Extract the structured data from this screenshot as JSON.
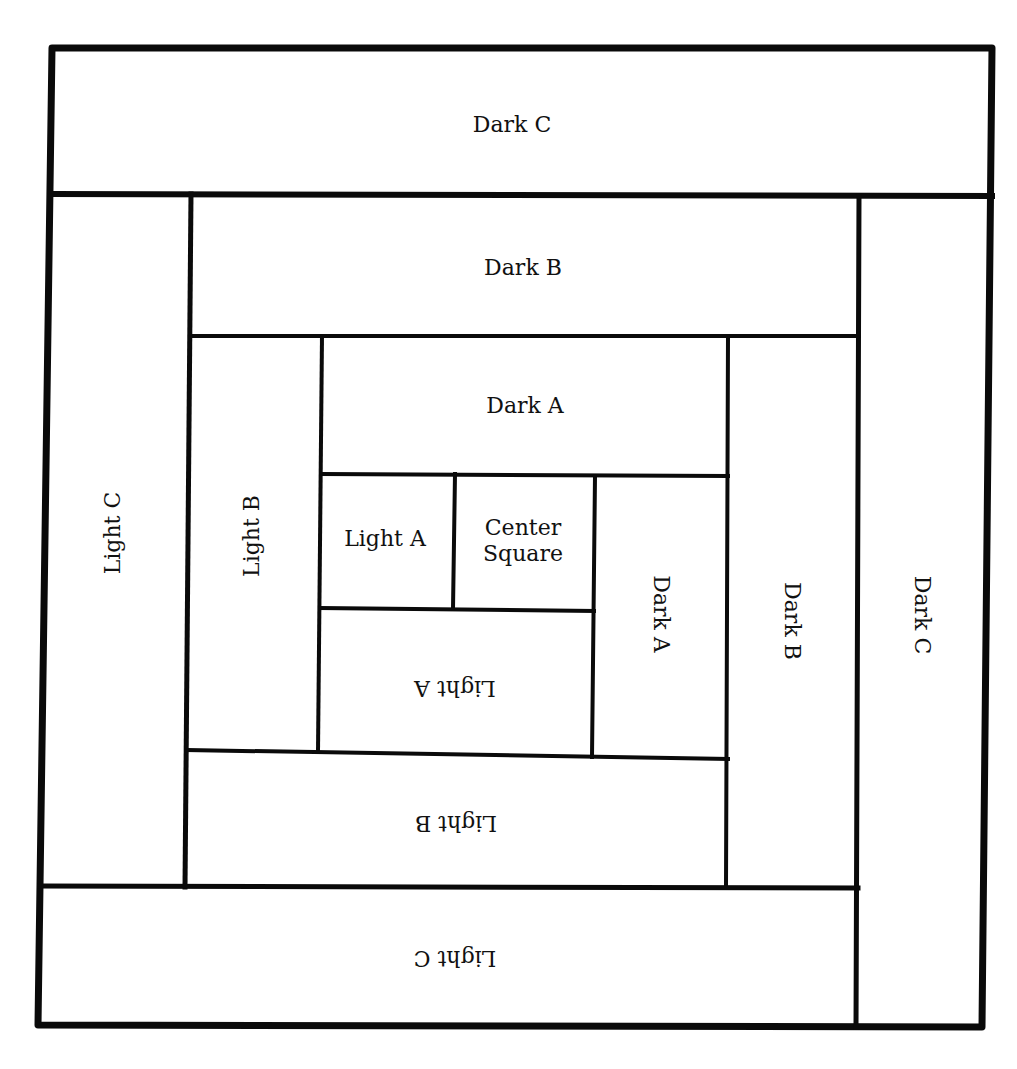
{
  "diagram": {
    "stroke_color": "#0a0a0a",
    "background": "#ffffff",
    "outer": {
      "x1": 52,
      "y1": 48,
      "x2": 992,
      "y2": 48,
      "x3": 982,
      "y3": 1027,
      "x4": 38,
      "y4": 1025,
      "stroke_width": 7
    },
    "pieces": [
      {
        "id": "dark-c-top",
        "label": "Dark C",
        "x": 52,
        "y": 48,
        "w": 940,
        "h": 146,
        "rotate": 0,
        "lx": 512,
        "ly": 125
      },
      {
        "id": "light-c-left",
        "label": "Light C",
        "x": 45,
        "y": 194,
        "w": 144,
        "h": 692,
        "rotate": -90,
        "lx": 113,
        "ly": 533
      },
      {
        "id": "dark-b-top",
        "label": "Dark B",
        "x": 189,
        "y": 194,
        "w": 668,
        "h": 142,
        "rotate": 0,
        "lx": 523,
        "ly": 268
      },
      {
        "id": "dark-c-right",
        "label": "Dark C",
        "x": 857,
        "y": 194,
        "w": 132,
        "h": 833,
        "rotate": 90,
        "lx": 922,
        "ly": 615
      },
      {
        "id": "light-b-left",
        "label": "Light B",
        "x": 189,
        "y": 336,
        "w": 132,
        "h": 416,
        "rotate": -90,
        "lx": 252,
        "ly": 536
      },
      {
        "id": "dark-a-top",
        "label": "Dark A",
        "x": 321,
        "y": 336,
        "w": 407,
        "h": 138,
        "rotate": 0,
        "lx": 525,
        "ly": 406
      },
      {
        "id": "dark-b-right",
        "label": "Dark B",
        "x": 728,
        "y": 336,
        "w": 129,
        "h": 552,
        "rotate": 90,
        "lx": 792,
        "ly": 621
      },
      {
        "id": "light-a-left",
        "label": "Light A",
        "x": 321,
        "y": 474,
        "w": 133,
        "h": 136,
        "rotate": 0,
        "lx": 385,
        "ly": 539
      },
      {
        "id": "center-square",
        "label": "Center Square",
        "x": 454,
        "y": 474,
        "w": 140,
        "h": 136,
        "rotate": 0,
        "lx": 523,
        "ly": 541
      },
      {
        "id": "dark-a-right",
        "label": "Dark A",
        "x": 594,
        "y": 474,
        "w": 134,
        "h": 284,
        "rotate": 90,
        "lx": 661,
        "ly": 614
      },
      {
        "id": "light-a-bottom",
        "label": "Light A",
        "x": 321,
        "y": 610,
        "w": 273,
        "h": 146,
        "rotate": 180,
        "lx": 455,
        "ly": 688
      },
      {
        "id": "light-b-bottom",
        "label": "Light B",
        "x": 189,
        "y": 754,
        "w": 539,
        "h": 133,
        "rotate": 180,
        "lx": 456,
        "ly": 823
      },
      {
        "id": "light-c-bottom",
        "label": "Light C",
        "x": 40,
        "y": 887,
        "w": 817,
        "h": 139,
        "rotate": 180,
        "lx": 455,
        "ly": 958
      }
    ],
    "lines": [
      {
        "x1": 52,
        "y1": 194,
        "x2": 992,
        "y2": 196,
        "w": 6
      },
      {
        "x1": 191,
        "y1": 194,
        "x2": 185,
        "y2": 887,
        "w": 5
      },
      {
        "x1": 859,
        "y1": 196,
        "x2": 856,
        "y2": 1027,
        "w": 5
      },
      {
        "x1": 191,
        "y1": 336,
        "x2": 859,
        "y2": 336,
        "w": 4
      },
      {
        "x1": 322,
        "y1": 336,
        "x2": 318,
        "y2": 752,
        "w": 4
      },
      {
        "x1": 728,
        "y1": 336,
        "x2": 726,
        "y2": 888,
        "w": 4
      },
      {
        "x1": 322,
        "y1": 474,
        "x2": 728,
        "y2": 476,
        "w": 4
      },
      {
        "x1": 455,
        "y1": 474,
        "x2": 453,
        "y2": 609,
        "w": 4
      },
      {
        "x1": 595,
        "y1": 476,
        "x2": 592,
        "y2": 757,
        "w": 4
      },
      {
        "x1": 320,
        "y1": 608,
        "x2": 594,
        "y2": 611,
        "w": 4
      },
      {
        "x1": 187,
        "y1": 750,
        "x2": 728,
        "y2": 759,
        "w": 4
      },
      {
        "x1": 40,
        "y1": 886,
        "x2": 858,
        "y2": 888,
        "w": 5
      }
    ]
  },
  "labels": {
    "dark_c_top": "Dark C",
    "dark_b_top": "Dark B",
    "dark_a_top": "Dark A",
    "light_c_left": "Light C",
    "light_b_left": "Light B",
    "light_a_left": "Light A",
    "center_line1": "Center",
    "center_line2": "Square",
    "dark_a_right": "Dark A",
    "dark_b_right": "Dark B",
    "dark_c_right": "Dark C",
    "light_a_bottom": "Light A",
    "light_b_bottom": "Light B",
    "light_c_bottom": "Light C"
  }
}
